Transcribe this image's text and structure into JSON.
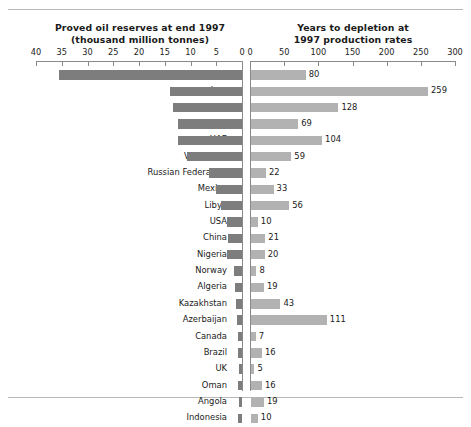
{
  "titles": {
    "left_line1": "Proved oil reserves at end 1997",
    "left_line2": "(thousand million tonnes)",
    "right_line1": "Years to depletion at",
    "right_line2": "1997 production rates"
  },
  "colors": {
    "bar_left": "#7d7d7d",
    "bar_right": "#b2b2b2",
    "axis": "#8a8a8a",
    "rule": "#b8b8b8",
    "text": "#1a1a1a",
    "background": "#ffffff"
  },
  "chart_data": {
    "type": "bar",
    "orientation": "horizontal",
    "layout": "butterfly",
    "grid": false,
    "legend": null,
    "categories": [
      "Saudi Arabia",
      "Iraq",
      "Kuwait",
      "Iran",
      "UAE",
      "Venezuela",
      "Russian Federation",
      "Mexico",
      "Libya",
      "USA",
      "China",
      "Nigeria",
      "Norway",
      "Algeria",
      "Kazakhstan",
      "Azerbaijan",
      "Canada",
      "Brazil",
      "UK",
      "Oman",
      "Angola",
      "Indonesia"
    ],
    "series": [
      {
        "name": "Proved oil reserves at end 1997",
        "unit": "thousand million tonnes",
        "axis": "left",
        "reversed": true,
        "xlabel": "",
        "xlim": [
          40,
          0
        ],
        "ticks": [
          40,
          35,
          30,
          25,
          20,
          15,
          10,
          5,
          0
        ],
        "labels_shown": false,
        "values": [
          35.5,
          14.0,
          13.4,
          12.5,
          12.4,
          10.6,
          6.5,
          5.0,
          4.0,
          3.0,
          2.8,
          2.9,
          1.5,
          1.3,
          1.1,
          0.9,
          0.7,
          0.8,
          0.6,
          0.7,
          0.6,
          0.7
        ]
      },
      {
        "name": "Years to depletion at 1997 production rates",
        "unit": "years",
        "axis": "right",
        "reversed": false,
        "xlabel": "",
        "xlim": [
          0,
          300
        ],
        "ticks": [
          0,
          50,
          100,
          150,
          200,
          250,
          300
        ],
        "labels_shown": true,
        "values": [
          80,
          259,
          128,
          69,
          104,
          59,
          22,
          33,
          56,
          10,
          21,
          20,
          8,
          19,
          43,
          111,
          7,
          16,
          5,
          16,
          19,
          10
        ]
      }
    ]
  }
}
